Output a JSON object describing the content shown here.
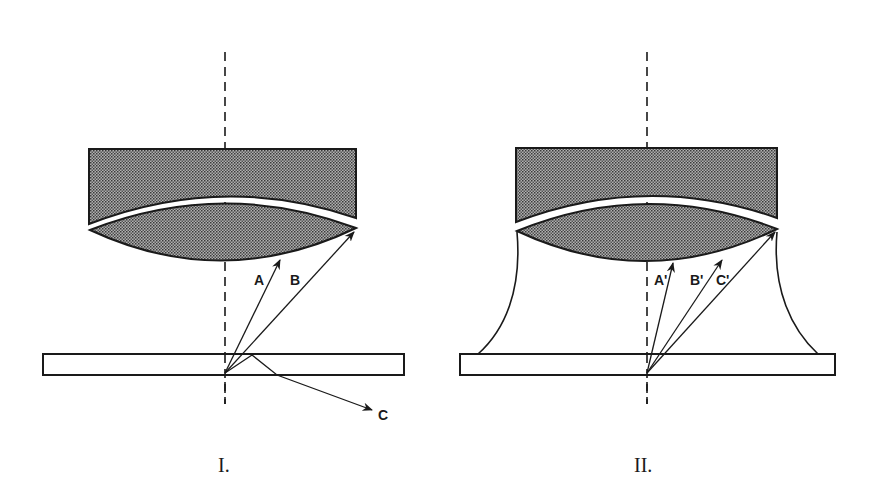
{
  "colors": {
    "ink": "#1a1a1a",
    "glass_fill": "#8a8a8a",
    "background": "#ffffff"
  },
  "panels": [
    {
      "id": "I",
      "label": "I.",
      "medium": "air",
      "rays": [
        {
          "label": "A",
          "type": "captured"
        },
        {
          "label": "B",
          "type": "captured"
        },
        {
          "label": "C",
          "type": "totally-reflected-escaping"
        }
      ]
    },
    {
      "id": "II",
      "label": "II.",
      "medium": "immersion-oil",
      "rays": [
        {
          "label": "A'",
          "type": "captured"
        },
        {
          "label": "B'",
          "type": "captured"
        },
        {
          "label": "C'",
          "type": "captured"
        }
      ]
    }
  ]
}
